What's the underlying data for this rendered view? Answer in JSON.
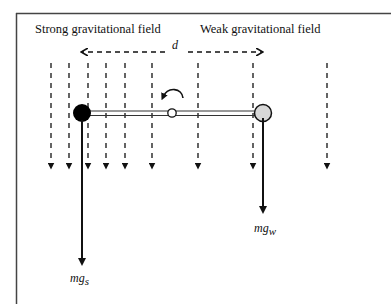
{
  "labels": {
    "strong_field": "Strong gravitational field",
    "weak_field": "Weak gravitational field",
    "distance": "d",
    "force_strong_main": "mg",
    "force_strong_sub": "s",
    "force_weak_main": "mg",
    "force_weak_sub": "w"
  },
  "field_lines_x": [
    51,
    69,
    88,
    106,
    125,
    152,
    198,
    253,
    327
  ],
  "colors": {
    "line": "#111111",
    "heavy_mass": "#000000",
    "light_mass": "#d8d8d8",
    "frame": "#444444"
  }
}
